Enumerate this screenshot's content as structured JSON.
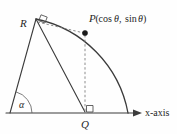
{
  "figure": {
    "type": "geometry-diagram",
    "background_color": "#fefefe",
    "line_color": "#3b3b3b",
    "dashed_color": "#7a7a7a",
    "label_color": "#262626"
  },
  "labels": {
    "point_r": "R",
    "point_p_name": "P",
    "point_p_open_paren": "(",
    "point_p_cos": "cos",
    "point_p_theta_1": "θ",
    "point_p_comma": ", ",
    "point_p_sin": "sin",
    "point_p_theta_2": "θ",
    "point_p_close_paren": ")",
    "point_p_full": "P(cosθ, sinθ)",
    "point_q": "Q",
    "angle_alpha": "α",
    "axis_x": "x-axis"
  },
  "geometry": {
    "origin": {
      "x": 10,
      "y": 113
    },
    "point_r": {
      "x": 36,
      "y": 19
    },
    "point_p": {
      "x": 85,
      "y": 33
    },
    "point_q": {
      "x": 85,
      "y": 112
    },
    "arc_end_on_axis": {
      "x": 128,
      "y": 113
    },
    "arc_radius": 118,
    "axis_start": {
      "x": 6,
      "y": 113
    },
    "axis_end": {
      "x": 140,
      "y": 113
    },
    "right_angles": [
      "at-R-between-RP-and-RO",
      "at-Q-between-QP-and-QX"
    ],
    "solid_segments": [
      "origin-to-R",
      "R-to-Q",
      "x-axis"
    ],
    "dashed_segments": [
      "R-to-P",
      "P-to-Q"
    ]
  }
}
